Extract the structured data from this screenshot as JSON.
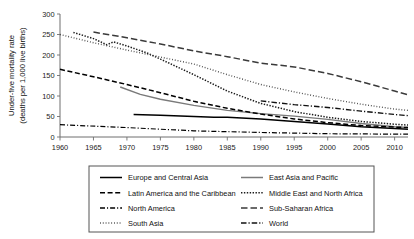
{
  "chart_data": {
    "type": "line",
    "title": "",
    "xlabel": "",
    "ylabel": "Under-five mortality rate (deaths per 1,000 live births)",
    "ylabel_line1": "Under-five mortality rate",
    "ylabel_line2": "(deaths per 1,000 live births)",
    "xlim": [
      1960,
      2012
    ],
    "ylim": [
      0,
      300
    ],
    "yticks": [
      0,
      50,
      100,
      150,
      200,
      250,
      300
    ],
    "ytick_labels": [
      "0",
      "50",
      "100",
      "150",
      "200",
      "250",
      "300"
    ],
    "xticks": [
      1960,
      1965,
      1970,
      1975,
      1980,
      1985,
      1990,
      1995,
      2000,
      2005,
      2010
    ],
    "xtick_labels": [
      "1960",
      "1965",
      "1970",
      "1975",
      "1980",
      "1985",
      "1990",
      "1995",
      "2000",
      "2005",
      "2010"
    ],
    "grid": false,
    "legend_position": "bottom",
    "series": [
      {
        "name": "Europe and Central Asia",
        "style": "solid",
        "color": "#000000",
        "width": 1.5,
        "x": [
          1971,
          1975,
          1980,
          1983,
          1985,
          1990,
          1995,
          2000,
          2005,
          2010,
          2012
        ],
        "values": [
          55,
          53,
          50,
          48,
          48,
          44,
          38,
          32,
          25,
          21,
          19
        ]
      },
      {
        "name": "East Asia and Pacific",
        "style": "solid",
        "color": "#7a7a7a",
        "width": 1.4,
        "x": [
          1969,
          1972,
          1975,
          1980,
          1985,
          1990,
          1995,
          2000,
          2005,
          2010,
          2012
        ],
        "values": [
          122,
          104,
          92,
          77,
          65,
          57,
          51,
          43,
          33,
          25,
          23
        ]
      },
      {
        "name": "Latin America and the Caribbean",
        "style": "dashed",
        "color": "#000000",
        "width": 1.5,
        "x": [
          1960,
          1965,
          1970,
          1975,
          1980,
          1985,
          1990,
          1995,
          2000,
          2005,
          2010,
          2012
        ],
        "values": [
          165,
          147,
          128,
          108,
          87,
          70,
          56,
          44,
          35,
          28,
          24,
          23
        ]
      },
      {
        "name": "Middle East and North Africa",
        "style": "dotted",
        "color": "#1a1a1a",
        "width": 1.5,
        "x": [
          1962,
          1965,
          1967,
          1968,
          1970,
          1973,
          1975,
          1980,
          1985,
          1990,
          1995,
          2000,
          2005,
          2010,
          2012
        ],
        "values": [
          255,
          240,
          225,
          232,
          222,
          205,
          190,
          152,
          112,
          82,
          62,
          48,
          38,
          31,
          29
        ]
      },
      {
        "name": "North America",
        "style": "dashdot",
        "color": "#000000",
        "width": 1.2,
        "x": [
          1960,
          1970,
          1980,
          1990,
          2000,
          2010,
          2012
        ],
        "values": [
          30,
          23,
          15,
          11,
          8,
          7,
          7
        ]
      },
      {
        "name": "Sub-Saharan Africa",
        "style": "longdash",
        "color": "#3a3a3a",
        "width": 1.5,
        "x": [
          1965,
          1970,
          1975,
          1980,
          1985,
          1990,
          1995,
          2000,
          2005,
          2010,
          2012
        ],
        "values": [
          256,
          242,
          227,
          210,
          196,
          180,
          171,
          155,
          135,
          112,
          103
        ]
      },
      {
        "name": "South Asia",
        "style": "finedot",
        "color": "#4a4a4a",
        "width": 1.4,
        "x": [
          1960,
          1965,
          1970,
          1975,
          1980,
          1985,
          1990,
          1995,
          2000,
          2005,
          2010,
          2012
        ],
        "values": [
          250,
          230,
          212,
          195,
          178,
          152,
          128,
          110,
          94,
          80,
          68,
          65
        ]
      },
      {
        "name": "World",
        "style": "dashdotdash",
        "color": "#111111",
        "width": 1.4,
        "x": [
          1990,
          1995,
          2000,
          2005,
          2010,
          2012
        ],
        "values": [
          88,
          79,
          72,
          63,
          55,
          52
        ]
      }
    ],
    "legend": [
      {
        "label": "Europe and Central Asia",
        "style": "solid",
        "color": "#000000",
        "column": "left"
      },
      {
        "label": "Latin America and the Caribbean",
        "style": "dashed",
        "color": "#000000",
        "column": "left"
      },
      {
        "label": "North America",
        "style": "dashdot",
        "color": "#000000",
        "column": "left"
      },
      {
        "label": "South Asia",
        "style": "finedot",
        "color": "#4a4a4a",
        "column": "left"
      },
      {
        "label": "East Asia and Pacific",
        "style": "solid",
        "color": "#7a7a7a",
        "column": "right"
      },
      {
        "label": "Middle East and North Africa",
        "style": "dotted",
        "color": "#1a1a1a",
        "column": "right"
      },
      {
        "label": "Sub-Saharan Africa",
        "style": "longdash",
        "color": "#3a3a3a",
        "column": "right"
      },
      {
        "label": "World",
        "style": "dashdotdash",
        "color": "#111111",
        "column": "right"
      }
    ]
  }
}
